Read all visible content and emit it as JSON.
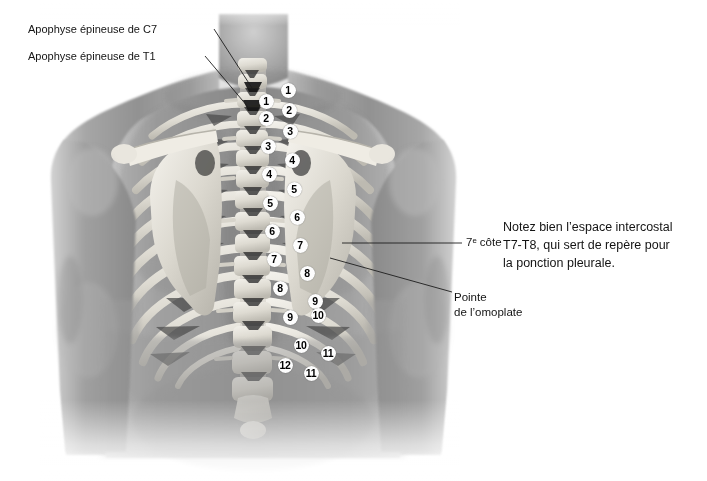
{
  "figure": {
    "kind": "anatomical-illustration",
    "background_color": "#ffffff",
    "skin_tone": "#9a9a9a",
    "bone_tone": "#e8e6e0"
  },
  "labels": {
    "c7": "Apophyse épineuse de C7",
    "t1": "Apophyse épineuse de T1",
    "rib7": "7ᵉ côte",
    "scapula_tip_line1": "Pointe",
    "scapula_tip_line2": "de l’omoplate"
  },
  "note": {
    "line1": "Notez bien l’espace intercostal",
    "line2": "T7-T8, qui sert de repère pour",
    "line3": "la ponction pleurale."
  },
  "vertebrae_markers": [
    {
      "label": "1",
      "x": 266,
      "y": 101
    },
    {
      "label": "2",
      "x": 266,
      "y": 118
    },
    {
      "label": "3",
      "x": 268,
      "y": 146
    },
    {
      "label": "4",
      "x": 269,
      "y": 174
    },
    {
      "label": "5",
      "x": 270,
      "y": 203
    },
    {
      "label": "6",
      "x": 272,
      "y": 231
    },
    {
      "label": "7",
      "x": 274,
      "y": 259
    },
    {
      "label": "8",
      "x": 280,
      "y": 288
    },
    {
      "label": "9",
      "x": 290,
      "y": 317
    },
    {
      "label": "10",
      "x": 301,
      "y": 345
    },
    {
      "label": "11",
      "x": 311,
      "y": 373
    },
    {
      "label": "12",
      "x": 285,
      "y": 365
    }
  ],
  "rib_markers": [
    {
      "label": "1",
      "x": 288,
      "y": 90
    },
    {
      "label": "2",
      "x": 289,
      "y": 110
    },
    {
      "label": "3",
      "x": 290,
      "y": 131
    },
    {
      "label": "4",
      "x": 292,
      "y": 160
    },
    {
      "label": "5",
      "x": 294,
      "y": 189
    },
    {
      "label": "6",
      "x": 297,
      "y": 217
    },
    {
      "label": "7",
      "x": 300,
      "y": 245
    },
    {
      "label": "8",
      "x": 307,
      "y": 273
    },
    {
      "label": "9",
      "x": 315,
      "y": 301
    },
    {
      "label": "10",
      "x": 318,
      "y": 315
    },
    {
      "label": "11",
      "x": 328,
      "y": 353
    }
  ]
}
